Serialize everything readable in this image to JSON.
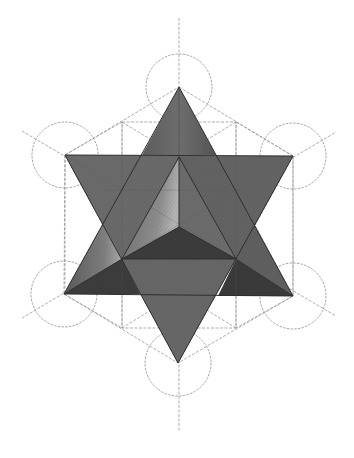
{
  "colors": {
    "background": "#ffffff",
    "guide_line": "#8a8a8a",
    "circle": "#8e8e8e",
    "edge": "#2e2e2e",
    "face_mid": "#6b6b6b",
    "face_dark": "#3f3f3f",
    "face_light": "#9c9c9c",
    "face_darker": "#353535"
  },
  "geometry": {
    "center": [
      179,
      225
    ],
    "circle_radius": 33,
    "circles": [
      {
        "name": "top",
        "cx": 179,
        "cy": 87
      },
      {
        "name": "upper-left",
        "cx": 65,
        "cy": 155
      },
      {
        "name": "upper-right",
        "cx": 293,
        "cy": 156
      },
      {
        "name": "lower-left",
        "cx": 64,
        "cy": 294
      },
      {
        "name": "lower-right",
        "cx": 293,
        "cy": 296
      },
      {
        "name": "bottom",
        "cx": 178,
        "cy": 363
      }
    ],
    "vertical_axis": {
      "x": 179,
      "y1": 18,
      "y2": 432
    },
    "up_triangle": [
      [
        179,
        87
      ],
      [
        64,
        294
      ],
      [
        293,
        296
      ]
    ],
    "down_triangle": [
      [
        65,
        155
      ],
      [
        293,
        156
      ],
      [
        178,
        363
      ]
    ],
    "inner_hexagon": [
      [
        122,
        122
      ],
      [
        236,
        122
      ],
      [
        236,
        328
      ],
      [
        122,
        328
      ]
    ],
    "inner_center_top": [
      179,
      157
    ],
    "inner_center_bottom": [
      179,
      227
    ],
    "inner_base": [
      [
        122,
        259
      ],
      [
        236,
        259
      ]
    ]
  }
}
